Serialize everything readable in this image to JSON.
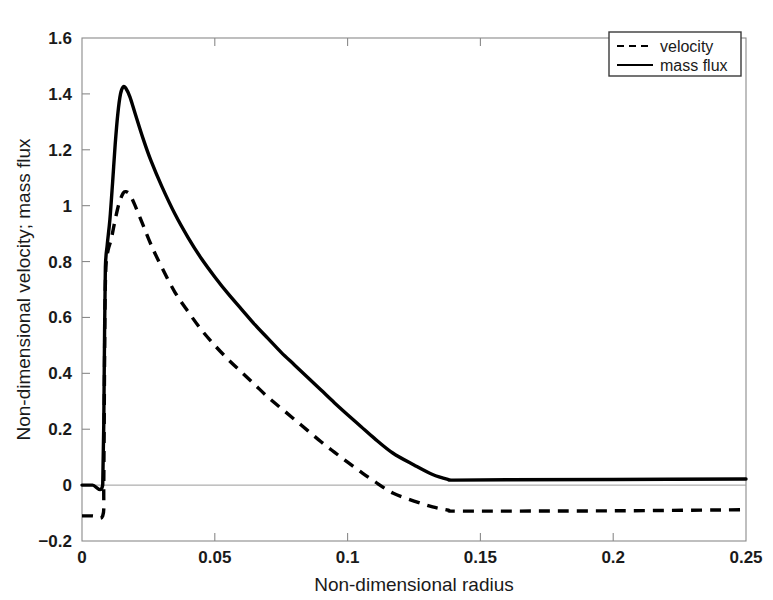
{
  "chart_data": {
    "type": "line",
    "title": "",
    "xlabel": "Non-dimensional radius",
    "ylabel": "Non-dimensional velocity; mass flux",
    "xlim": [
      0,
      0.25
    ],
    "ylim": [
      -0.2,
      1.6
    ],
    "xticks": [
      0,
      0.05,
      0.1,
      0.15,
      0.2,
      0.25
    ],
    "xtick_labels": [
      "0",
      "0.05",
      "0.1",
      "0.15",
      "0.2",
      "0.25"
    ],
    "yticks": [
      -0.2,
      0,
      0.2,
      0.4,
      0.6,
      0.8,
      1,
      1.2,
      1.4,
      1.6
    ],
    "ytick_labels": [
      "-0.2",
      "0",
      "0.2",
      "0.4",
      "0.6",
      "0.8",
      "1",
      "1.2",
      "1.4",
      "1.6"
    ],
    "grid": false,
    "legend_position": "top-right",
    "series": [
      {
        "name": "velocity",
        "style": "dashed",
        "color": "#000000",
        "points": [
          [
            0.0,
            -0.11
          ],
          [
            0.004,
            -0.11
          ],
          [
            0.0078,
            -0.11
          ],
          [
            0.0082,
            0.0
          ],
          [
            0.0084,
            0.3
          ],
          [
            0.0086,
            0.6
          ],
          [
            0.009,
            0.78
          ],
          [
            0.0098,
            0.84
          ],
          [
            0.011,
            0.88
          ],
          [
            0.0125,
            0.95
          ],
          [
            0.014,
            1.01
          ],
          [
            0.0155,
            1.045
          ],
          [
            0.0165,
            1.05
          ],
          [
            0.018,
            1.04
          ],
          [
            0.02,
            1.0
          ],
          [
            0.023,
            0.93
          ],
          [
            0.026,
            0.86
          ],
          [
            0.03,
            0.78
          ],
          [
            0.035,
            0.69
          ],
          [
            0.04,
            0.62
          ],
          [
            0.045,
            0.555
          ],
          [
            0.05,
            0.5
          ],
          [
            0.055,
            0.45
          ],
          [
            0.06,
            0.405
          ],
          [
            0.065,
            0.36
          ],
          [
            0.07,
            0.315
          ],
          [
            0.075,
            0.275
          ],
          [
            0.08,
            0.235
          ],
          [
            0.085,
            0.195
          ],
          [
            0.09,
            0.155
          ],
          [
            0.095,
            0.118
          ],
          [
            0.1,
            0.082
          ],
          [
            0.105,
            0.047
          ],
          [
            0.11,
            0.014
          ],
          [
            0.117,
            -0.028
          ],
          [
            0.125,
            -0.057
          ],
          [
            0.132,
            -0.078
          ],
          [
            0.138,
            -0.09
          ],
          [
            0.14,
            -0.093
          ],
          [
            0.16,
            -0.093
          ],
          [
            0.2,
            -0.092
          ],
          [
            0.25,
            -0.088
          ]
        ]
      },
      {
        "name": "mass flux",
        "style": "solid",
        "color": "#000000",
        "points": [
          [
            0.0,
            0.0
          ],
          [
            0.004,
            0.0
          ],
          [
            0.0078,
            0.0
          ],
          [
            0.0082,
            0.22
          ],
          [
            0.0085,
            0.55
          ],
          [
            0.0088,
            0.78
          ],
          [
            0.0095,
            0.86
          ],
          [
            0.0105,
            0.95
          ],
          [
            0.0115,
            1.08
          ],
          [
            0.0125,
            1.22
          ],
          [
            0.0135,
            1.33
          ],
          [
            0.0145,
            1.4
          ],
          [
            0.0155,
            1.425
          ],
          [
            0.0165,
            1.42
          ],
          [
            0.018,
            1.39
          ],
          [
            0.02,
            1.33
          ],
          [
            0.023,
            1.24
          ],
          [
            0.026,
            1.16
          ],
          [
            0.03,
            1.07
          ],
          [
            0.035,
            0.97
          ],
          [
            0.04,
            0.885
          ],
          [
            0.045,
            0.81
          ],
          [
            0.05,
            0.745
          ],
          [
            0.055,
            0.685
          ],
          [
            0.06,
            0.63
          ],
          [
            0.065,
            0.575
          ],
          [
            0.07,
            0.525
          ],
          [
            0.075,
            0.475
          ],
          [
            0.08,
            0.43
          ],
          [
            0.085,
            0.385
          ],
          [
            0.09,
            0.34
          ],
          [
            0.095,
            0.295
          ],
          [
            0.1,
            0.252
          ],
          [
            0.105,
            0.21
          ],
          [
            0.11,
            0.168
          ],
          [
            0.117,
            0.115
          ],
          [
            0.125,
            0.072
          ],
          [
            0.132,
            0.038
          ],
          [
            0.138,
            0.02
          ],
          [
            0.14,
            0.018
          ],
          [
            0.16,
            0.019
          ],
          [
            0.2,
            0.02
          ],
          [
            0.25,
            0.022
          ]
        ]
      }
    ]
  },
  "legend": {
    "entries": [
      {
        "label": "velocity",
        "style": "dashed"
      },
      {
        "label": "mass flux",
        "style": "solid"
      }
    ]
  }
}
